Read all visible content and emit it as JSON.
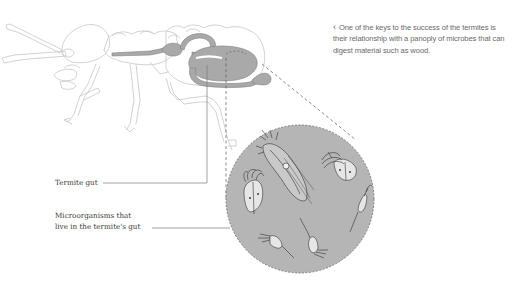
{
  "caption": {
    "arrow_icon": "‹",
    "text": "One of the keys to the success of the termites is their relationship with a panoply of microbes that can digest material such as wood."
  },
  "labels": {
    "termite_gut": "Termite gut",
    "microorganisms_line1": "Microorganisms that",
    "microorganisms_line2": "live in the termite's gut"
  },
  "colors": {
    "outline": "#c8c8c8",
    "gut_fill": "#a9a9a9",
    "gut_stroke": "#7e7e7e",
    "circle_fill": "#b5b5b5",
    "leader_line": "#7a7a7a",
    "caption_text": "#6a6a6a",
    "label_text": "#3a3a3a"
  },
  "diagram": {
    "subject": "termite",
    "magnified_view": "microorganisms (flagellate protists) in circular inset"
  }
}
